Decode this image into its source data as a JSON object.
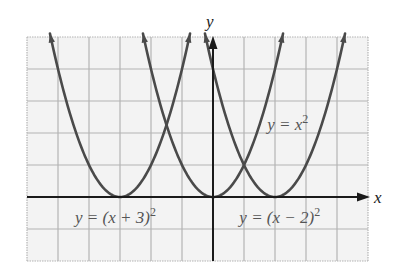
{
  "chart_data": {
    "type": "line",
    "title": "",
    "xlabel": "x",
    "ylabel": "y",
    "xlim": [
      -6,
      5
    ],
    "ylim": [
      -2,
      5
    ],
    "grid": true,
    "grid_step": 1,
    "legend": null,
    "series": [
      {
        "name": "y = (x + 3)^2",
        "label": "y = (x + 3)",
        "exponent": "2",
        "h": -3,
        "x": [
          -5.26,
          -5,
          -4.5,
          -4,
          -3.5,
          -3,
          -2.5,
          -2,
          -1.5,
          -0.74
        ],
        "values": [
          5.1,
          4,
          2.25,
          1,
          0.25,
          0,
          0.25,
          1,
          2.25,
          5.1
        ],
        "label_pos": [
          -4.45,
          -0.8
        ]
      },
      {
        "name": "y = x^2",
        "label": "y = x",
        "exponent": "2",
        "h": 0,
        "x": [
          -2.26,
          -2,
          -1.5,
          -1,
          -0.5,
          0,
          0.5,
          1,
          1.5,
          2.26
        ],
        "values": [
          5.1,
          4,
          2.25,
          1,
          0.25,
          0,
          0.25,
          1,
          2.25,
          5.1
        ],
        "label_pos": [
          1.75,
          2.1
        ]
      },
      {
        "name": "y = (x - 2)^2",
        "label": "y = (x − 2)",
        "exponent": "2",
        "h": 2,
        "x": [
          -0.26,
          0,
          0.5,
          1,
          1.5,
          2,
          2.5,
          3,
          3.5,
          4.26
        ],
        "values": [
          5.1,
          4,
          2.25,
          1,
          0.25,
          0,
          0.25,
          1,
          2.25,
          5.1
        ],
        "label_pos": [
          0.85,
          -0.8
        ]
      }
    ],
    "colors": {
      "curve": "#4a4a4a",
      "axis": "#1a1a1a",
      "grid": "#b4b4b4",
      "background": "#f3f3f3",
      "label": "#555555"
    }
  }
}
